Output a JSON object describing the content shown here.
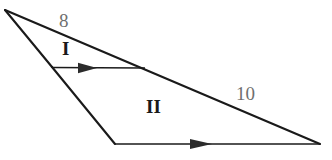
{
  "figure": {
    "background_color": "#ffffff",
    "stroke_color": "#1a1a1a",
    "side_label_color": "#6f6f6f",
    "region_label_color": "#1a1a1a",
    "labels": {
      "side_top": "8",
      "side_right": "10",
      "region_upper": "I",
      "region_lower": "II"
    },
    "vertices": {
      "apex": {
        "x": 5,
        "y": 10
      },
      "left_mid": {
        "x": 52,
        "y": 67
      },
      "cross_right": {
        "x": 145,
        "y": 68
      },
      "bottom_left": {
        "x": 115,
        "y": 144
      },
      "bottom_right": {
        "x": 320,
        "y": 144
      }
    },
    "segments": [
      {
        "name": "hypotenuse-long",
        "from": "apex",
        "to": "bottom_right",
        "label": "10",
        "arrow": false
      },
      {
        "name": "edge-apex-to-left-mid",
        "from": "apex",
        "to": "left_mid",
        "label": "",
        "arrow": false
      },
      {
        "name": "edge-left-mid-to-bottom-left",
        "from": "left_mid",
        "to": "bottom_left",
        "label": "",
        "arrow": false
      },
      {
        "name": "transversal-upper",
        "from": "left_mid",
        "to": "cross_right",
        "label": "",
        "arrow": true
      },
      {
        "name": "base-lower",
        "from": "bottom_left",
        "to": "bottom_right",
        "label": "",
        "arrow": true
      }
    ],
    "arrow_markers": [
      {
        "name": "arrow-on-upper-transversal",
        "x": 88,
        "y": 68,
        "direction": "right"
      },
      {
        "name": "arrow-on-lower-base",
        "x": 201,
        "y": 144,
        "direction": "right"
      }
    ]
  }
}
